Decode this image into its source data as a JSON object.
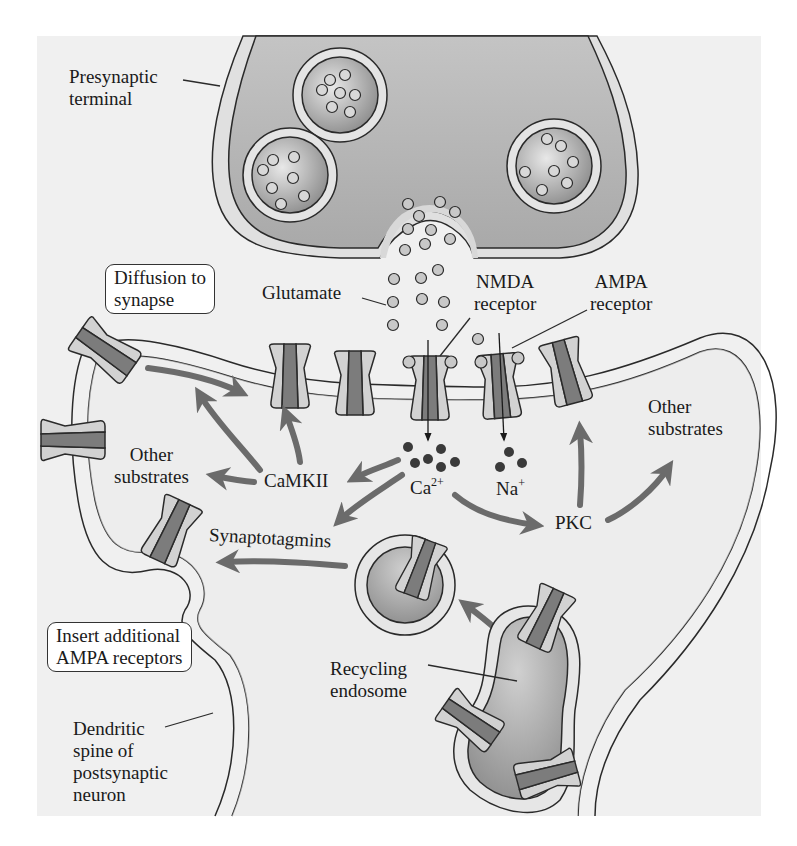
{
  "diagram": {
    "type": "biological-schematic",
    "colors": {
      "background": "#f1f1f1",
      "terminal_fill": "#b9b9b9",
      "membrane": "#e2e2e2",
      "outline": "#2a2a2a",
      "receptor_light": "#cfcfcf",
      "receptor_dark": "#7a7a7a",
      "arrow": "#6b6b6b",
      "ion_dot": "#3a3a3a",
      "glutamate_dot": "#c8c8c8"
    }
  },
  "labels": {
    "presynaptic_terminal": [
      "Presynaptic",
      "terminal"
    ],
    "diffusion_box": [
      "Diffusion to",
      "synapse"
    ],
    "glutamate": "Glutamate",
    "nmda_receptor": [
      "NMDA",
      "receptor"
    ],
    "ampa_receptor": [
      "AMPA",
      "receptor"
    ],
    "other_substrates_left": [
      "Other",
      "substrates"
    ],
    "camkii": "CaMKII",
    "ca_base": "Ca",
    "ca_charge": "2+",
    "na_base": "Na",
    "na_charge": "+",
    "other_substrates_right": [
      "Other",
      "substrates"
    ],
    "pkc": "PKC",
    "synaptotagmins": "Synaptotagmins",
    "insert_box": [
      "Insert additional",
      "AMPA receptors"
    ],
    "recycling_endosome": [
      "Recycling",
      "endosome"
    ],
    "dendritic_spine": [
      "Dendritic",
      "spine of",
      "postsynaptic",
      "neuron"
    ]
  },
  "nodes": [
    {
      "id": "presynaptic_terminal",
      "label": "Presynaptic terminal"
    },
    {
      "id": "glutamate",
      "label": "Glutamate"
    },
    {
      "id": "nmda",
      "label": "NMDA receptor"
    },
    {
      "id": "ampa",
      "label": "AMPA receptor"
    },
    {
      "id": "ca",
      "label": "Ca2+"
    },
    {
      "id": "na",
      "label": "Na+"
    },
    {
      "id": "camkii",
      "label": "CaMKII"
    },
    {
      "id": "pkc",
      "label": "PKC"
    },
    {
      "id": "synaptotagmins",
      "label": "Synaptotagmins"
    },
    {
      "id": "other_left",
      "label": "Other substrates"
    },
    {
      "id": "other_right",
      "label": "Other substrates"
    },
    {
      "id": "recycling_endosome",
      "label": "Recycling endosome"
    },
    {
      "id": "diffusion",
      "label": "Diffusion to synapse"
    },
    {
      "id": "insert",
      "label": "Insert additional AMPA receptors"
    },
    {
      "id": "spine",
      "label": "Dendritic spine of postsynaptic neuron"
    }
  ],
  "edges": [
    {
      "from": "nmda",
      "to": "ca"
    },
    {
      "from": "ampa",
      "to": "na"
    },
    {
      "from": "ca",
      "to": "camkii"
    },
    {
      "from": "ca",
      "to": "synaptotagmins"
    },
    {
      "from": "ca",
      "to": "pkc"
    },
    {
      "from": "camkii",
      "to": "other_left"
    },
    {
      "from": "camkii",
      "to": "ampa"
    },
    {
      "from": "camkii",
      "to": "diffusion"
    },
    {
      "from": "pkc",
      "to": "ampa"
    },
    {
      "from": "pkc",
      "to": "other_right"
    },
    {
      "from": "recycling_endosome",
      "to": "insert"
    },
    {
      "from": "insert",
      "to": "spine"
    },
    {
      "from": "diffusion",
      "to": "ampa"
    }
  ]
}
